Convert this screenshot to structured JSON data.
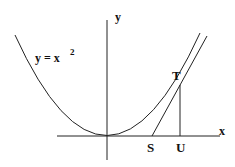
{
  "diagram": {
    "curve_label": "y = x",
    "curve_exponent": "2",
    "axis_x_label": "x",
    "axis_y_label": "y",
    "point_T": "T",
    "point_S": "S",
    "point_U": "U"
  }
}
